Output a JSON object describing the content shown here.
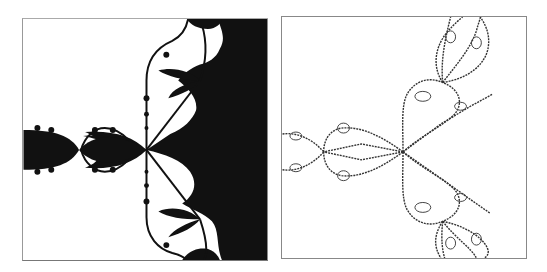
{
  "figure": {
    "panels": [
      {
        "id": "left",
        "description": "Filled Julia-set style fractal (black basin, white background)",
        "fill_color": "#111111",
        "background": "#ffffff"
      },
      {
        "id": "right",
        "description": "Boundary-only Julia-set style fractal (outline drawn in dark gray)",
        "stroke_color": "#333333",
        "background": "#ffffff"
      }
    ]
  }
}
